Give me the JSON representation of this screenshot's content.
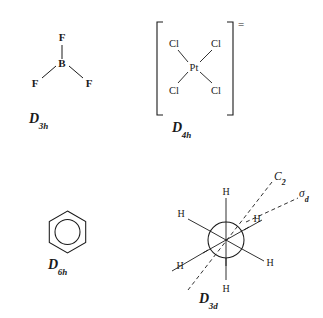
{
  "figure": {
    "type": "chemistry-point-group-illustration",
    "background_color": "#ffffff",
    "ink_color": "#1a1a1a",
    "width": 323,
    "height": 318
  },
  "molecules": [
    {
      "id": "boron-trifluoride",
      "name": "BF3",
      "geometry": "trigonal planar",
      "center_atom": "B",
      "ligand_atoms": [
        "F",
        "F",
        "F"
      ],
      "labels": {
        "center": "B",
        "top": "F",
        "left": "F",
        "right": "F"
      },
      "point_group": {
        "letter": "D",
        "subscript": "3h",
        "full": "D3h"
      }
    },
    {
      "id": "tetrachloroplatinate",
      "name": "PtCl4 2-",
      "geometry": "square planar",
      "center_atom": "Pt",
      "ligand_atoms": [
        "Cl",
        "Cl",
        "Cl",
        "Cl"
      ],
      "labels": {
        "center": "Pt",
        "top_left": "Cl",
        "top_right": "Cl",
        "bottom_left": "Cl",
        "bottom_right": "Cl"
      },
      "brackets": true,
      "charge": "=",
      "charge_meaning": "2-",
      "point_group": {
        "letter": "D",
        "subscript": "4h",
        "full": "D4h"
      }
    },
    {
      "id": "benzene",
      "name": "C6H6",
      "geometry": "planar hexagon with aromatic circle",
      "representation": "hexagon-with-inner-circle",
      "point_group": {
        "letter": "D",
        "subscript": "6h",
        "full": "D6h"
      }
    },
    {
      "id": "ethane-newman",
      "name": "C2H6",
      "geometry": "staggered Newman projection",
      "front_hydrogens": [
        "H",
        "H",
        "H"
      ],
      "back_hydrogens": [
        "H",
        "H",
        "H"
      ],
      "hydrogen_label": "H",
      "symmetry_elements": [
        {
          "id": "c2-axis",
          "letter": "C",
          "subscript": "2",
          "full": "C2",
          "style": "dashed"
        },
        {
          "id": "sigma-d-plane",
          "letter": "σ",
          "subscript": "d",
          "full": "σd",
          "style": "dashed"
        }
      ],
      "point_group": {
        "letter": "D",
        "subscript": "3d",
        "full": "D3d"
      }
    }
  ]
}
